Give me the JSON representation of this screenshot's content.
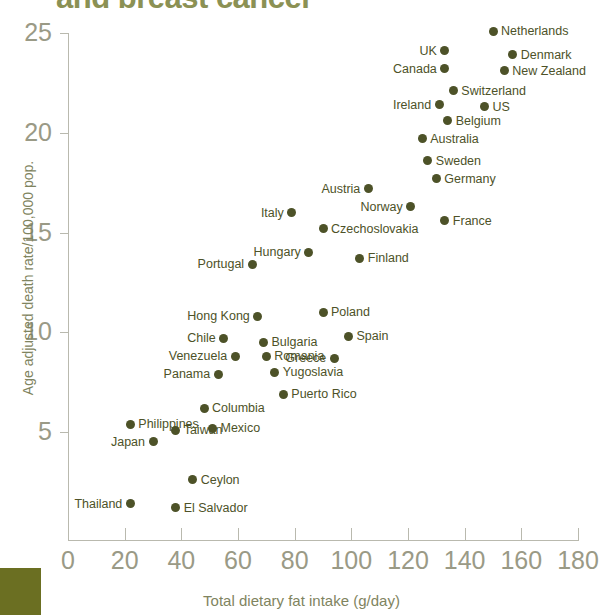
{
  "chart_title": "and breast cancer",
  "axes": {
    "x_title": "Total dietary fat intake (g/day)",
    "y_title": "Age adjusted death rate/100,000 pop.",
    "x_ticks": [
      0,
      20,
      40,
      60,
      80,
      100,
      120,
      140,
      160,
      180
    ],
    "y_ticks": [
      5,
      10,
      15,
      20,
      25
    ]
  },
  "colors": {
    "point": "#4d5228",
    "axis": "#b9b9ae",
    "tick_text": "#9a9a86",
    "title": "#8b9154",
    "swatch": "#6b6f22"
  },
  "chart_data": {
    "type": "scatter",
    "title": "and breast cancer",
    "xlabel": "Total dietary fat intake (g/day)",
    "ylabel": "Age adjusted death rate/100,000 pop.",
    "xlim": [
      0,
      180
    ],
    "ylim": [
      0,
      26
    ],
    "grid": false,
    "legend": "none",
    "points": [
      {
        "label": "Netherlands",
        "x": 150,
        "y": 25.1,
        "label_pos": "right"
      },
      {
        "label": "UK",
        "x": 133,
        "y": 24.1,
        "label_pos": "left"
      },
      {
        "label": "Denmark",
        "x": 157,
        "y": 23.9,
        "label_pos": "right"
      },
      {
        "label": "Canada",
        "x": 133,
        "y": 23.2,
        "label_pos": "left"
      },
      {
        "label": "New Zealand",
        "x": 154,
        "y": 23.1,
        "label_pos": "right"
      },
      {
        "label": "Switzerland",
        "x": 136,
        "y": 22.1,
        "label_pos": "right"
      },
      {
        "label": "Ireland",
        "x": 131,
        "y": 21.4,
        "label_pos": "left"
      },
      {
        "label": "US",
        "x": 147,
        "y": 21.3,
        "label_pos": "right"
      },
      {
        "label": "Belgium",
        "x": 134,
        "y": 20.6,
        "label_pos": "right"
      },
      {
        "label": "Australia",
        "x": 125,
        "y": 19.7,
        "label_pos": "right"
      },
      {
        "label": "Sweden",
        "x": 127,
        "y": 18.6,
        "label_pos": "right"
      },
      {
        "label": "Germany",
        "x": 130,
        "y": 17.7,
        "label_pos": "right"
      },
      {
        "label": "Austria",
        "x": 106,
        "y": 17.2,
        "label_pos": "left"
      },
      {
        "label": "Norway",
        "x": 121,
        "y": 16.3,
        "label_pos": "left"
      },
      {
        "label": "Italy",
        "x": 79,
        "y": 16.0,
        "label_pos": "left"
      },
      {
        "label": "France",
        "x": 133,
        "y": 15.6,
        "label_pos": "right"
      },
      {
        "label": "Czechoslovakia",
        "x": 90,
        "y": 15.2,
        "label_pos": "right"
      },
      {
        "label": "Hungary",
        "x": 85,
        "y": 14.0,
        "label_pos": "left"
      },
      {
        "label": "Finland",
        "x": 103,
        "y": 13.7,
        "label_pos": "right"
      },
      {
        "label": "Portugal",
        "x": 65,
        "y": 13.4,
        "label_pos": "left"
      },
      {
        "label": "Poland",
        "x": 90,
        "y": 11.0,
        "label_pos": "right"
      },
      {
        "label": "Hong Kong",
        "x": 67,
        "y": 10.8,
        "label_pos": "left"
      },
      {
        "label": "Spain",
        "x": 99,
        "y": 9.8,
        "label_pos": "right"
      },
      {
        "label": "Chile",
        "x": 55,
        "y": 9.7,
        "label_pos": "left"
      },
      {
        "label": "Bulgaria",
        "x": 69,
        "y": 9.5,
        "label_pos": "right"
      },
      {
        "label": "Greece",
        "x": 94,
        "y": 8.7,
        "label_pos": "left"
      },
      {
        "label": "Venezuela",
        "x": 59,
        "y": 8.8,
        "label_pos": "left"
      },
      {
        "label": "Romania",
        "x": 70,
        "y": 8.8,
        "label_pos": "right"
      },
      {
        "label": "Yugoslavia",
        "x": 73,
        "y": 8.0,
        "label_pos": "right"
      },
      {
        "label": "Panama",
        "x": 53,
        "y": 7.9,
        "label_pos": "left"
      },
      {
        "label": "Puerto Rico",
        "x": 76,
        "y": 6.9,
        "label_pos": "right"
      },
      {
        "label": "Columbia",
        "x": 48,
        "y": 6.2,
        "label_pos": "right"
      },
      {
        "label": "Philippines",
        "x": 22,
        "y": 5.4,
        "label_pos": "right"
      },
      {
        "label": "Mexico",
        "x": 51,
        "y": 5.2,
        "label_pos": "right"
      },
      {
        "label": "Taiwan",
        "x": 38,
        "y": 5.1,
        "label_pos": "right"
      },
      {
        "label": "Japan",
        "x": 30,
        "y": 4.5,
        "label_pos": "left"
      },
      {
        "label": "Ceylon",
        "x": 44,
        "y": 2.6,
        "label_pos": "right"
      },
      {
        "label": "El Salvador",
        "x": 38,
        "y": 1.2,
        "label_pos": "right"
      },
      {
        "label": "Thailand",
        "x": 22,
        "y": 1.4,
        "label_pos": "left"
      }
    ]
  }
}
